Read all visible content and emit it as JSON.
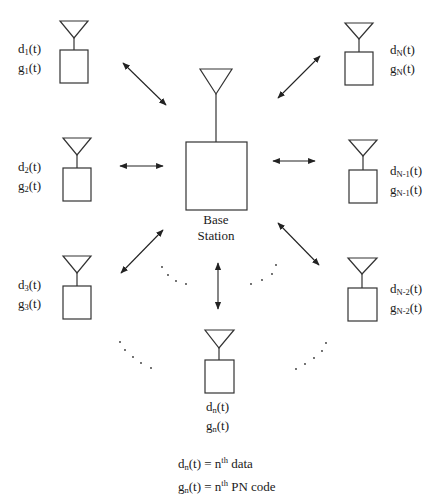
{
  "diagram": {
    "type": "CDMA multi-user system",
    "base_station": {
      "label_line1": "Base",
      "label_line2": "Station"
    },
    "terminals": [
      {
        "id": "t1",
        "data_sym": "d",
        "code_sym": "g",
        "sub": "1",
        "arg": "(t)"
      },
      {
        "id": "tN",
        "data_sym": "d",
        "code_sym": "g",
        "sub": "N",
        "arg": "(t)"
      },
      {
        "id": "t2",
        "data_sym": "d",
        "code_sym": "g",
        "sub": "2",
        "arg": "(t)"
      },
      {
        "id": "tN-1",
        "data_sym": "d",
        "code_sym": "g",
        "sub": "N-1",
        "arg": "(t)"
      },
      {
        "id": "t3",
        "data_sym": "d",
        "code_sym": "g",
        "sub": "3",
        "arg": "(t)"
      },
      {
        "id": "tN-2",
        "data_sym": "d",
        "code_sym": "g",
        "sub": "N-2",
        "arg": "(t)"
      },
      {
        "id": "tn",
        "data_sym": "d",
        "code_sym": "g",
        "sub": "n",
        "arg": "(t)"
      }
    ],
    "ellipsis": "· · · ·",
    "legend": {
      "line1": {
        "lhs_sym": "d",
        "sub": "n",
        "arg": "(t) = n",
        "sup": "th",
        "rhs": " data"
      },
      "line2": {
        "lhs_sym": "g",
        "sub": "n",
        "arg": "(t) = n",
        "sup": "th",
        "rhs": " PN code"
      }
    },
    "colors": {
      "stroke": "#333333",
      "text": "#1a1a1a",
      "background": "#ffffff"
    }
  }
}
